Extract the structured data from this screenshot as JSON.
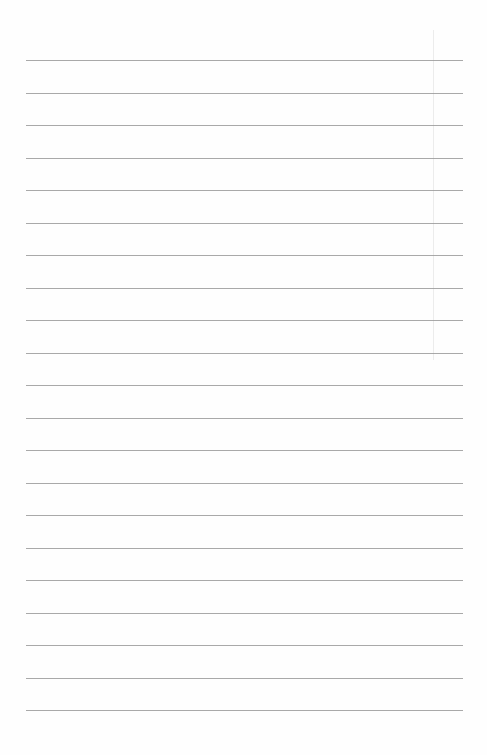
{
  "paper": {
    "type": "lined-paper",
    "background_color": "#fefefe",
    "line_color": "#9a9a9a",
    "line_count": 21,
    "first_line_y": 60,
    "line_spacing": 32.5,
    "line_left": 26,
    "line_width": 437,
    "text_content": ""
  }
}
